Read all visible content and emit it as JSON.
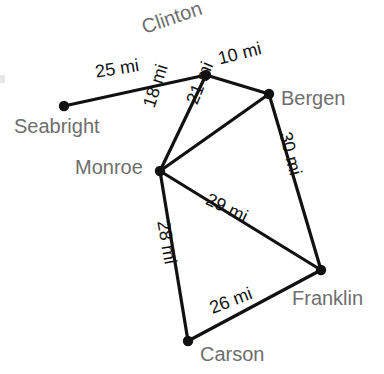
{
  "figure": {
    "type": "weighted-graph-diagram",
    "title": "",
    "width": 384,
    "height": 374,
    "background_color": "#ffffff",
    "node_color": "#111111",
    "edge_color": "#111111",
    "city_label_color": "#6e6e6e",
    "edge_label_color": "#121212",
    "unit": "mi"
  },
  "nodes": [
    {
      "id": "seabright",
      "label": "Seabright",
      "x": 64,
      "y": 106,
      "label_x": 14,
      "label_y": 116,
      "label_rotation": 0
    },
    {
      "id": "clinton",
      "label": "Clinton",
      "x": 206,
      "y": 75,
      "label_x": 139,
      "label_y": 18,
      "label_rotation": -19
    },
    {
      "id": "bergen",
      "label": "Bergen",
      "x": 269,
      "y": 94,
      "label_x": 281,
      "label_y": 88,
      "label_rotation": 0
    },
    {
      "id": "monroe",
      "label": "Monroe",
      "x": 160,
      "y": 171,
      "label_x": 75,
      "label_y": 157,
      "label_rotation": 0
    },
    {
      "id": "franklin",
      "label": "Franklin",
      "x": 321,
      "y": 270,
      "label_x": 292,
      "label_y": 288,
      "label_rotation": 0
    },
    {
      "id": "carson",
      "label": "Carson",
      "x": 188,
      "y": 341,
      "label_x": 200,
      "label_y": 344,
      "label_rotation": 0
    }
  ],
  "edges": [
    {
      "id": "seabright-clinton",
      "from": "seabright",
      "to": "clinton",
      "weight": 25,
      "label": "25 mi",
      "label_x": 94,
      "label_y": 63,
      "label_rotation": -9
    },
    {
      "id": "clinton-bergen",
      "from": "clinton",
      "to": "bergen",
      "weight": 10,
      "label": "10 mi",
      "label_x": 216,
      "label_y": 50,
      "label_rotation": -14
    },
    {
      "id": "clinton-monroe",
      "from": "clinton",
      "to": "monroe",
      "weight": 18,
      "label": "18 mi",
      "label_x": 140,
      "label_y": 104,
      "label_rotation": -72
    },
    {
      "id": "monroe-bergen",
      "from": "monroe",
      "to": "bergen",
      "weight": 21,
      "label": "21 mi",
      "label_x": 183,
      "label_y": 100,
      "label_rotation": -68
    },
    {
      "id": "bergen-franklin",
      "from": "bergen",
      "to": "franklin",
      "weight": 30,
      "label": "30 mi",
      "label_x": 294,
      "label_y": 130,
      "label_rotation": 76
    },
    {
      "id": "monroe-franklin",
      "from": "monroe",
      "to": "franklin",
      "weight": 29,
      "label": "29 mi",
      "label_x": 211,
      "label_y": 190,
      "label_rotation": 26
    },
    {
      "id": "monroe-carson",
      "from": "monroe",
      "to": "carson",
      "weight": 28,
      "label": "28 mi",
      "label_x": 172,
      "label_y": 219,
      "label_rotation": 80
    },
    {
      "id": "carson-franklin",
      "from": "carson",
      "to": "franklin",
      "weight": 26,
      "label": "26 mi",
      "label_x": 207,
      "label_y": 300,
      "label_rotation": -21
    }
  ]
}
